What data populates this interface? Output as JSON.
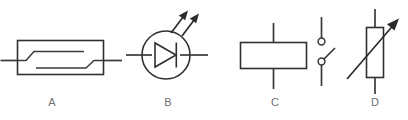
{
  "figure": {
    "type": "electronic-symbol-set",
    "background_color": "#ffffff",
    "line_color": "#2f2f33",
    "caption_color": "#6e6e73",
    "width": 408,
    "height": 120
  },
  "symbols": [
    {
      "id": "a",
      "caption": "A",
      "name": "thermostat-bimetallic-strip-symbol",
      "description": "Rectangular enclosure containing a bimetallic strip contact with two offset horizontal lines joined by diagonal segments; horizontal leads exit left and right"
    },
    {
      "id": "b",
      "caption": "B",
      "name": "light-emitting-diode-symbol",
      "description": "Diode triangle with cathode bar inside a circle, horizontal leads left and right, two diagonal emission arrows pointing up and to the right"
    },
    {
      "id": "c",
      "caption": "C",
      "name": "relay-coil-with-contacts-symbol",
      "description": "Rectangular coil body with vertical leads top and bottom, plus a separate normally-open switch contact pair with two small open circles to the right"
    },
    {
      "id": "d",
      "caption": "D",
      "name": "variable-resistor-symbol",
      "description": "Vertical rectangular resistor body with vertical leads top and bottom, crossed by a diagonal arrow pointing up and to the right"
    }
  ],
  "captions": {
    "a": "A",
    "b": "B",
    "c": "C",
    "d": "D"
  }
}
